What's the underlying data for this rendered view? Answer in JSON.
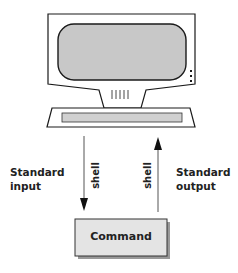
{
  "diagram": {
    "terminal": {
      "label": "Terminal (screen and keyboard)",
      "screen_color": "#c8c8c8",
      "keyboard_bar_color": "#d0d0d0",
      "body_color": "#ffffff",
      "outline_color": "#1a1a1a"
    },
    "input_arrow": {
      "label": "Standard input",
      "line1": "Standard",
      "line2": "input",
      "shell_label": "shell",
      "direction": "down"
    },
    "output_arrow": {
      "label": "Standard output",
      "line1": "Standard",
      "line2": "output",
      "shell_label": "shell",
      "direction": "up"
    },
    "command_box": {
      "label": "Command",
      "fill_color": "#e4e4e4"
    }
  }
}
